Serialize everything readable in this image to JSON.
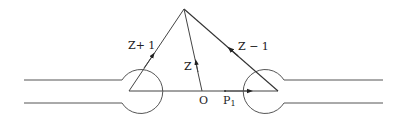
{
  "diagram": {
    "labels": {
      "z_plus_1": "Z+ 1",
      "z_minus_1": "Z − 1",
      "z": "Z",
      "origin": "O",
      "p": "P",
      "p_sub": "1"
    },
    "colors": {
      "stroke": "#333333",
      "background": "#ffffff"
    }
  }
}
